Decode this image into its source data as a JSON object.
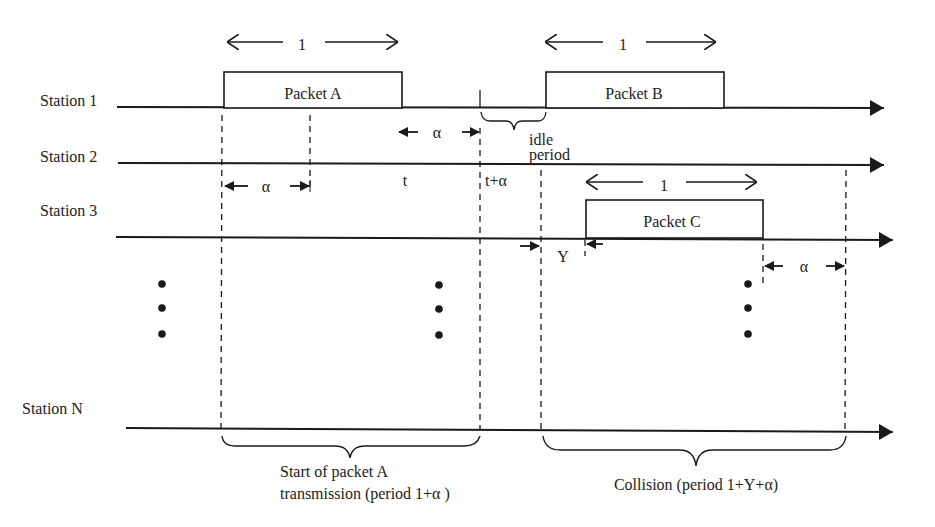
{
  "diagram": {
    "title": "",
    "stations": [
      {
        "label": "Station 1"
      },
      {
        "label": "Station 2"
      },
      {
        "label": "Station 3"
      },
      {
        "label": "Station N"
      }
    ],
    "packets": [
      {
        "label": "Packet A",
        "station": "Station 1",
        "duration_label": "1"
      },
      {
        "label": "Packet B",
        "station": "Station 1",
        "duration_label": "1"
      },
      {
        "label": "Packet C",
        "station": "Station 3",
        "duration_label": "1"
      }
    ],
    "annotations": {
      "alpha_station2": "α",
      "alpha_before_t_alpha": "α",
      "alpha_after_packet_c": "α",
      "t": "t",
      "t_plus_alpha": "t+α",
      "idle_line1": "idle",
      "idle_line2": "period",
      "y_gap": "Y"
    },
    "braces": {
      "start_line1": "Start of packet A",
      "start_line2": "transmission (period 1+α )",
      "collision": "Collision (period 1+Y+α)"
    },
    "colors": {
      "line": "#1a1a1a",
      "text": "#222222",
      "background": "#ffffff"
    }
  }
}
